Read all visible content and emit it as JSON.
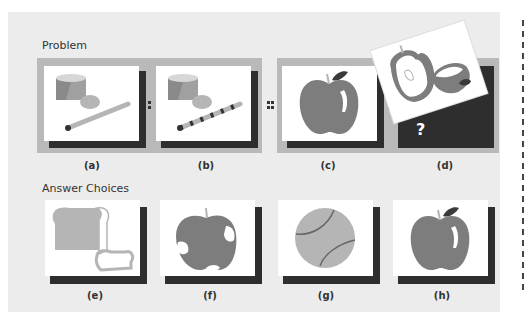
{
  "problem": {
    "title": "Problem",
    "items": [
      {
        "label": "(a)",
        "image": "drum-with-plain-stick"
      },
      {
        "label": "(b)",
        "image": "drum-with-striped-stick"
      },
      {
        "label": "(c)",
        "image": "whole-apple"
      },
      {
        "label": "(d)",
        "image": "unknown-question-mark",
        "overlay_image": "cut-apple-halves",
        "placeholder": "?"
      }
    ],
    "separators": [
      ":",
      "::",
      ":"
    ]
  },
  "answers": {
    "title": "Answer Choices",
    "items": [
      {
        "label": "(e)",
        "image": "bread-loaf-and-slice"
      },
      {
        "label": "(f)",
        "image": "bruised-apple"
      },
      {
        "label": "(g)",
        "image": "tennis-ball"
      },
      {
        "label": "(h)",
        "image": "whole-apple"
      }
    ]
  },
  "colors": {
    "panel": "#ececec",
    "strip": "#b9b9b9",
    "shadow": "#2e2e2e",
    "apple": "#7d7d7d",
    "light_gray": "#b5b5b5",
    "drum_top": "#d7d7d7"
  }
}
